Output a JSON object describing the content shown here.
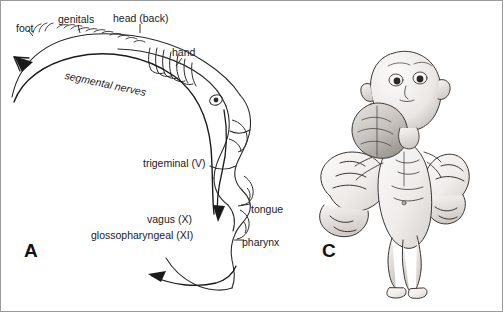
{
  "figure": {
    "panels": [
      {
        "id": "A",
        "letter": "A",
        "caption": "sensory homunculus nerve field diagram"
      },
      {
        "id": "C",
        "letter": "C",
        "caption": "sensory homunculus figurine"
      }
    ],
    "labels": [
      {
        "key": "foot",
        "text": "foot",
        "x": 16,
        "y": 23
      },
      {
        "key": "genitals",
        "text": "genitals",
        "x": 58,
        "y": 16
      },
      {
        "key": "head_back",
        "text": "head (back)",
        "x": 113,
        "y": 15
      },
      {
        "key": "hand",
        "text": "hand",
        "x": 172,
        "y": 49
      },
      {
        "key": "segmental_nerves",
        "text": "segmental nerves",
        "x": 66,
        "y": 73
      },
      {
        "key": "trigeminal",
        "text": "trigeminal (V)",
        "x": 143,
        "y": 160
      },
      {
        "key": "vagus",
        "text": "vagus (X)",
        "x": 147,
        "y": 216
      },
      {
        "key": "glossopharyngeal",
        "text": "glossopharyngeal (XI)",
        "x": 91,
        "y": 232
      },
      {
        "key": "tongue",
        "text": "tongue",
        "x": 251,
        "y": 206
      },
      {
        "key": "pharynx",
        "text": "pharynx",
        "x": 242,
        "y": 239
      }
    ],
    "colors": {
      "ink": "#1a1a1a",
      "outline": "#222222",
      "figure_fill": "#f2f0ee",
      "shade_light": "#e2dfdc",
      "shade_mid": "#c9c5c1",
      "shade_dark": "#a9a4a0",
      "background": "#ffffff",
      "border": "#9a9a9a"
    }
  }
}
